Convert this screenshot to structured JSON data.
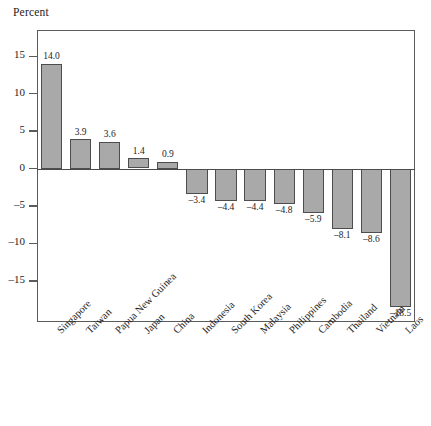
{
  "chart_data": {
    "type": "bar",
    "title": "",
    "ylabel": "Percent",
    "xlabel": "",
    "ylim": [
      -20.5,
      18.5
    ],
    "grid": false,
    "legend": "none",
    "yticks": [
      "15",
      "10",
      "5",
      "0",
      "–5",
      "–10",
      "–15"
    ],
    "ytick_values": [
      15,
      10,
      5,
      0,
      -5,
      -10,
      -15
    ],
    "categories": [
      "Singapore",
      "Taiwan",
      "Papua New Guinea",
      "Japan",
      "China",
      "Indonesia",
      "South Korea",
      "Malaysia",
      "Philippines",
      "Cambodia",
      "Thailand",
      "Vietnam",
      "Laos"
    ],
    "values": [
      14.0,
      3.9,
      3.6,
      1.4,
      0.9,
      -3.4,
      -4.4,
      -4.4,
      -4.8,
      -5.9,
      -8.1,
      -8.6,
      -18.5
    ],
    "data_labels": [
      "14.0",
      "3.9",
      "3.6",
      "1.4",
      "0.9",
      "–3.4",
      "–4.4",
      "–4.4",
      "–4.8",
      "–5.9",
      "–8.1",
      "–8.6",
      "–18.5"
    ],
    "bar_fill_color": "#a9a9a9",
    "bar_edge_color": "#4d4d4d",
    "frame_color": "#5b5b5b",
    "text_color": "#1d1d1d"
  }
}
